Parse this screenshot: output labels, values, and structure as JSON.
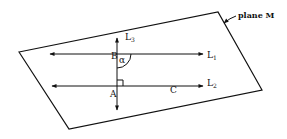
{
  "diagram": {
    "plane": {
      "label": "plane M",
      "points": "19,52 218,12 262,90 69,129",
      "stroke": "#111111"
    },
    "lines": [
      {
        "id": "L1",
        "name": "L",
        "subscript": "1",
        "x1": 50,
        "y1": 54,
        "x2": 203,
        "y2": 54
      },
      {
        "id": "L2",
        "name": "L",
        "subscript": "2",
        "x1": 52,
        "y1": 86,
        "x2": 203,
        "y2": 86
      },
      {
        "id": "L3",
        "name": "L",
        "subscript": "3",
        "x1": 117,
        "y1": 38,
        "x2": 117,
        "y2": 110
      }
    ],
    "points": [
      {
        "id": "B",
        "label": "B"
      },
      {
        "id": "A",
        "label": "A"
      },
      {
        "id": "C",
        "label": "C"
      }
    ],
    "angle": {
      "label": "α",
      "at": "B",
      "between": [
        "L3",
        "L1"
      ]
    },
    "right_angle": {
      "at": "A",
      "between": [
        "L3",
        "L2"
      ]
    }
  }
}
